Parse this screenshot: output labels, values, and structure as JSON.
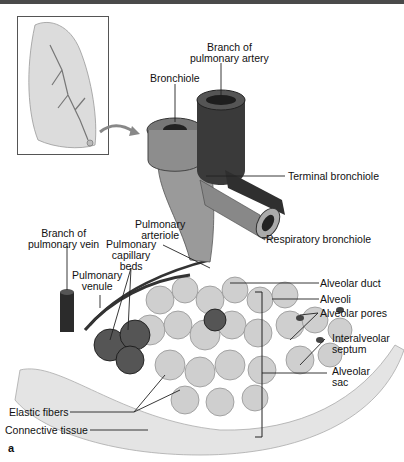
{
  "figure": {
    "panel_letter": "a",
    "labels": {
      "branch_pulmonary_artery_1": "Branch of",
      "branch_pulmonary_artery_2": "pulmonary artery",
      "bronchiole": "Bronchiole",
      "terminal_bronchiole": "Terminal bronchiole",
      "respiratory_bronchiole": "Respiratory bronchiole",
      "pulmonary_arteriole_1": "Pulmonary",
      "pulmonary_arteriole_2": "arteriole",
      "branch_pulmonary_vein_1": "Branch of",
      "branch_pulmonary_vein_2": "pulmonary vein",
      "pulmonary_capillary_beds_1": "Pulmonary",
      "pulmonary_capillary_beds_2": "capillary",
      "pulmonary_capillary_beds_3": "beds",
      "pulmonary_venule_1": "Pulmonary",
      "pulmonary_venule_2": "venule",
      "alveolar_duct": "Alveolar duct",
      "alveoli": "Alveoli",
      "alveolar_pores": "Alveolar pores",
      "interalveolar_septum_1": "Interalveolar",
      "interalveolar_septum_2": "septum",
      "alveolar_sac_1": "Alveolar",
      "alveolar_sac_2": "sac",
      "elastic_fibers": "Elastic fibers",
      "connective_tissue": "Connective tissue"
    },
    "colors": {
      "line": "#222222",
      "vessel_dark": "#2b2b2b",
      "tissue_light": "#e4e4e4",
      "alveolus": "#cfcfcf"
    }
  }
}
